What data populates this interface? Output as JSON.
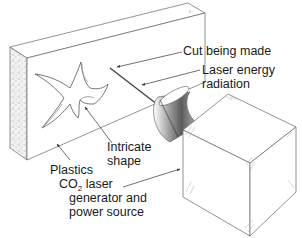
{
  "figure": {
    "type": "labeled illustration"
  },
  "labels": {
    "cut": "Cut being made",
    "laser_line1": "Laser energy",
    "laser_line2": "radiation",
    "intricate_line1": "Intricate",
    "intricate_line2": "shape",
    "plastics": "Plastics",
    "co2_prefix": "CO",
    "co2_sub": "2",
    "co2_line1_rest": " laser",
    "co2_line2": "generator and",
    "co2_line3": "power source"
  },
  "colors": {
    "line": "#555555",
    "text": "#1a1a1a",
    "shading": "#8a8a8a",
    "background": "#ffffff"
  }
}
